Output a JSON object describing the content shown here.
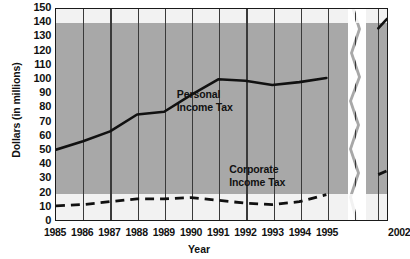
{
  "chart_data": {
    "type": "line",
    "title": "",
    "xlabel": "Year",
    "ylabel": "Dollars (in millions)",
    "ylim": [
      0,
      150
    ],
    "ytick_step": 10,
    "yticks": [
      150,
      140,
      130,
      120,
      110,
      100,
      90,
      80,
      70,
      60,
      50,
      40,
      30,
      20,
      10,
      0
    ],
    "x": [
      "1985",
      "1986",
      "1987",
      "1988",
      "1989",
      "1990",
      "1991",
      "1992",
      "1993",
      "1994",
      "1995",
      "2002"
    ],
    "axis_break": true,
    "axis_break_note": "x-axis is broken between 1995 and 2002",
    "grid": "horizontal alternating gray bands every 20 units; vertical gridlines at each year",
    "legend_position": "inline labels on plot",
    "series": [
      {
        "name": "Personal Income Tax",
        "style": "solid",
        "color": "#111111",
        "values": [
          50,
          56,
          63,
          75,
          77,
          89,
          100,
          99,
          96,
          98,
          101,
          143
        ],
        "label_line1": "Personal",
        "label_line2": "Income Tax"
      },
      {
        "name": "Corporate Income Tax",
        "style": "dashed",
        "color": "#111111",
        "values": [
          10,
          11,
          13,
          15,
          15,
          16,
          14,
          12,
          11,
          13,
          18,
          35
        ],
        "label_line1": "Corporate",
        "label_line2": "Income Tax"
      }
    ]
  },
  "colors": {
    "band_gray": "#a8a8a8",
    "band_light": "#f2f2f2",
    "axis": "#1a1a1a",
    "gridline": "#3a3a3a",
    "line": "#111111",
    "page_background": "#ffffff"
  }
}
